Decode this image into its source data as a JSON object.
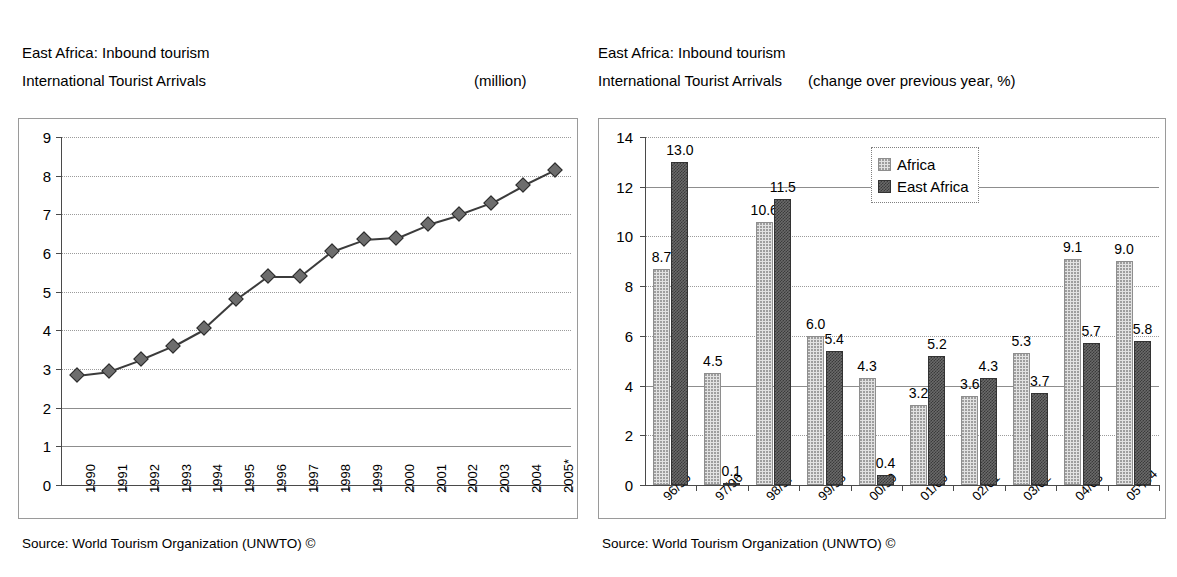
{
  "left": {
    "title_line1": "East Africa: Inbound tourism",
    "title_line2": "International Tourist Arrivals",
    "unit": "(million)",
    "source": "Source: World Tourism Organization (UNWTO) ©",
    "chart_data": {
      "type": "line",
      "title": "East Africa: Inbound tourism — International Tourist Arrivals",
      "xlabel": "",
      "ylabel": "(million)",
      "ylim": [
        0,
        9
      ],
      "yticks": [
        "0",
        "1",
        "2",
        "3",
        "4",
        "5",
        "6",
        "7",
        "8",
        "9"
      ],
      "grid": true,
      "legend_position": "none",
      "categories": [
        "1990",
        "1991",
        "1992",
        "1993",
        "1994",
        "1995",
        "1996",
        "1997",
        "1998",
        "1999",
        "2000",
        "2001",
        "2002",
        "2003",
        "2004",
        "2005*"
      ],
      "values": [
        2.85,
        2.95,
        3.25,
        3.6,
        4.05,
        4.8,
        5.4,
        5.4,
        6.05,
        6.35,
        6.4,
        6.75,
        7.0,
        7.3,
        7.75,
        8.15
      ]
    }
  },
  "right": {
    "title_line1": "East Africa: Inbound tourism",
    "title_line2": "International Tourist Arrivals",
    "unit": "(change over previous year, %)",
    "source": "Source: World Tourism Organization (UNWTO) ©",
    "legend": {
      "africa": "Africa",
      "east_africa": "East Africa"
    },
    "chart_data": {
      "type": "bar",
      "title": "East Africa: Inbound tourism — International Tourist Arrivals",
      "xlabel": "",
      "ylabel": "(change over previous year, %)",
      "ylim": [
        0,
        14
      ],
      "yticks": [
        "0",
        "2",
        "4",
        "6",
        "8",
        "10",
        "12",
        "14"
      ],
      "grid": true,
      "legend_position": "top-center",
      "categories": [
        "96/95",
        "97/96",
        "98/97",
        "99/98",
        "00/99",
        "01/00",
        "02/01",
        "03/02",
        "04/03",
        "05*/04"
      ],
      "series": [
        {
          "name": "Africa",
          "color": "#e2e2e2",
          "values": [
            8.7,
            4.5,
            10.6,
            6.0,
            4.3,
            3.2,
            3.6,
            5.3,
            9.1,
            9.0
          ],
          "labels": [
            "8.7",
            "4.5",
            "10.6",
            "6.0",
            "4.3",
            "3.2",
            "3.6",
            "5.3",
            "9.1",
            "9.0"
          ]
        },
        {
          "name": "East Africa",
          "color": "#5a5a5a",
          "values": [
            13.0,
            0.1,
            11.5,
            5.4,
            0.4,
            5.2,
            4.3,
            3.7,
            5.7,
            5.8
          ],
          "labels": [
            "13.0",
            "0.1",
            "11.5",
            "5.4",
            "0.4",
            "5.2",
            "4.3",
            "3.7",
            "5.7",
            "5.8"
          ]
        }
      ]
    }
  }
}
